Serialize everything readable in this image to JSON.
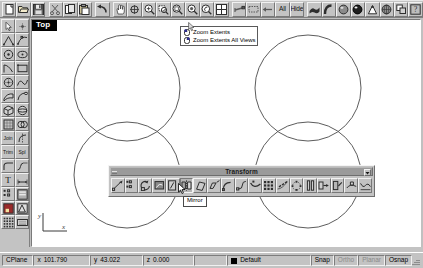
{
  "app": {
    "name": "Rhinoceros",
    "bg_color": "#c0c0c0",
    "accent_color": "#000080"
  },
  "top_toolbar": {
    "name": "standard-toolbar",
    "buttons": [
      {
        "name": "new-file",
        "icon": "new-document-icon",
        "label": ""
      },
      {
        "name": "open-file",
        "icon": "open-folder-icon",
        "label": ""
      },
      {
        "name": "save-file",
        "icon": "save-disk-icon",
        "label": ""
      },
      {
        "name": "cut",
        "icon": "scissors-icon",
        "label": ""
      },
      {
        "name": "copy",
        "icon": "copy-icon",
        "label": ""
      },
      {
        "name": "paste",
        "icon": "paste-icon",
        "label": ""
      },
      {
        "name": "undo",
        "icon": "undo-arrow-icon",
        "label": ""
      },
      {
        "name": "pan",
        "icon": "hand-pan-icon",
        "label": ""
      },
      {
        "name": "zoom-dynamic",
        "icon": "zoom-move-icon",
        "label": ""
      },
      {
        "name": "zoom-in",
        "icon": "magnifier-plus-icon",
        "label": ""
      },
      {
        "name": "zoom-window",
        "icon": "magnifier-window-icon",
        "label": ""
      },
      {
        "name": "zoom-extents",
        "icon": "magnifier-extents-icon",
        "label": ""
      },
      {
        "name": "zoom-selected",
        "icon": "magnifier-selected-icon",
        "label": ""
      },
      {
        "name": "zoom-previous",
        "icon": "magnifier-prev-icon",
        "label": ""
      },
      {
        "name": "viewport-layout",
        "icon": "four-view-grid-icon",
        "label": ""
      },
      {
        "name": "select-objects",
        "icon": "select-arrow-icon",
        "label": ""
      },
      {
        "name": "select-none",
        "icon": "select-none-icon",
        "label": ""
      },
      {
        "name": "select-previous",
        "icon": "select-previous-icon",
        "label": ""
      },
      {
        "name": "select-all",
        "icon": "text-icon",
        "label": "All"
      },
      {
        "name": "hide-objects",
        "icon": "text-icon",
        "label": "Hide"
      },
      {
        "name": "shade-view",
        "icon": "shade-surface-icon",
        "label": ""
      },
      {
        "name": "render-preview",
        "icon": "render-curve-icon",
        "label": ""
      },
      {
        "name": "render-shaded",
        "icon": "sphere-shaded-icon",
        "label": ""
      },
      {
        "name": "render",
        "icon": "sphere-render-icon",
        "label": ""
      },
      {
        "name": "spotlight",
        "icon": "spotlight-icon",
        "label": ""
      },
      {
        "name": "render-properties",
        "icon": "render-globe-icon",
        "label": ""
      },
      {
        "name": "layers",
        "icon": "layers-icon",
        "label": ""
      },
      {
        "name": "help",
        "icon": "help-question-icon",
        "label": ""
      }
    ]
  },
  "left_toolbar": {
    "name": "main-tools-toolbar",
    "buttons": [
      {
        "name": "select-pointer",
        "icon": "arrow-pointer-icon",
        "label": ""
      },
      {
        "name": "point-object",
        "icon": "point-dot-icon",
        "label": ""
      },
      {
        "name": "polyline",
        "icon": "polyline-icon",
        "label": ""
      },
      {
        "name": "curve-control",
        "icon": "curve-point-icon",
        "label": ""
      },
      {
        "name": "circle",
        "icon": "circle-icon",
        "label": ""
      },
      {
        "name": "ellipse",
        "icon": "ellipse-icon",
        "label": ""
      },
      {
        "name": "arc",
        "icon": "arc-icon",
        "label": ""
      },
      {
        "name": "rectangle",
        "icon": "rectangle-icon",
        "label": ""
      },
      {
        "name": "circle-center",
        "icon": "circle-center-icon",
        "label": ""
      },
      {
        "name": "freeform-curve",
        "icon": "freeform-curve-icon",
        "label": ""
      },
      {
        "name": "surface-loft",
        "icon": "surface-loft-icon",
        "label": ""
      },
      {
        "name": "surface-sweep",
        "icon": "surface-sweep-icon",
        "label": ""
      },
      {
        "name": "box-solid",
        "icon": "box-solid-icon",
        "label": ""
      },
      {
        "name": "sphere-solid",
        "icon": "sphere-solid-icon",
        "label": ""
      },
      {
        "name": "mesh-object",
        "icon": "mesh-icon",
        "label": ""
      },
      {
        "name": "boolean-tools",
        "icon": "boolean-icon",
        "label": ""
      },
      {
        "name": "join",
        "icon": "text-icon",
        "label": "Join"
      },
      {
        "name": "split",
        "icon": "split-halves-icon",
        "label": ""
      },
      {
        "name": "trim",
        "icon": "text-icon",
        "label": "Trim"
      },
      {
        "name": "split-tool",
        "icon": "text-icon",
        "label": "Spl"
      },
      {
        "name": "fillet-curves",
        "icon": "fillet-icon",
        "label": ""
      },
      {
        "name": "blend-curves",
        "icon": "blend-icon",
        "label": ""
      },
      {
        "name": "text-object",
        "icon": "text-icon",
        "label": "T"
      },
      {
        "name": "dimension",
        "icon": "dimension-icon",
        "label": ""
      },
      {
        "name": "analyze-points",
        "icon": "analyze-points-icon",
        "label": ""
      },
      {
        "name": "object-props",
        "icon": "properties-icon",
        "label": ""
      },
      {
        "name": "render-tools",
        "icon": "render-tools-icon",
        "label": ""
      },
      {
        "name": "drafting",
        "icon": "drafting-icon",
        "label": ""
      },
      {
        "name": "grid-snap",
        "icon": "grid-snap-icon",
        "label": ""
      },
      {
        "name": "keyboard-panel",
        "icon": "keyboard-icon",
        "label": ""
      }
    ]
  },
  "viewport": {
    "name": "top-viewport",
    "title": "Top",
    "background": "#ffffff",
    "axis": {
      "x_label": "x",
      "y_label": "y"
    },
    "geometry": {
      "type": "circles",
      "stroke": "#4a4a4a",
      "items": [
        {
          "name": "circle-top-left",
          "cx": 95,
          "cy": 68,
          "r": 53
        },
        {
          "name": "circle-top-right",
          "cx": 276,
          "cy": 68,
          "r": 53
        },
        {
          "name": "circle-bottom-left",
          "cx": 95,
          "cy": 155,
          "r": 53
        },
        {
          "name": "circle-bottom-right",
          "cx": 276,
          "cy": 155,
          "r": 53
        }
      ]
    }
  },
  "zoom_popup": {
    "name": "zoom-extents-flyout",
    "items": [
      {
        "label": "Zoom Extents",
        "icon": "mouse-left-button-icon"
      },
      {
        "label": "Zoom Extents All Views",
        "icon": "mouse-right-button-icon"
      }
    ]
  },
  "transform_toolbar": {
    "name": "transform-toolbar",
    "title": "Transform",
    "close_label": "▾",
    "buttons": [
      {
        "name": "move",
        "icon": "move-icon"
      },
      {
        "name": "copy",
        "icon": "copy-objects-icon"
      },
      {
        "name": "rotate",
        "icon": "rotate-icon"
      },
      {
        "name": "rotate-3d",
        "icon": "rotate-3d-icon"
      },
      {
        "name": "scale-1d",
        "icon": "scale-1d-icon"
      },
      {
        "name": "mirror",
        "icon": "mirror-icon"
      },
      {
        "name": "shear",
        "icon": "shear-icon"
      },
      {
        "name": "taper",
        "icon": "taper-icon"
      },
      {
        "name": "bend",
        "icon": "bend-icon"
      },
      {
        "name": "twist",
        "icon": "twist-icon"
      },
      {
        "name": "flow-along-curve",
        "icon": "flow-curve-icon"
      },
      {
        "name": "array-rectangular",
        "icon": "array-grid-icon"
      },
      {
        "name": "array-curve",
        "icon": "array-curve-icon"
      },
      {
        "name": "array-polar",
        "icon": "array-polar-icon"
      },
      {
        "name": "orient-2-points",
        "icon": "orient-two-point-icon"
      },
      {
        "name": "orient-3-points",
        "icon": "orient-three-point-icon"
      },
      {
        "name": "orient-perp",
        "icon": "orient-perp-icon"
      },
      {
        "name": "orient-on-srf",
        "icon": "orient-surface-icon"
      },
      {
        "name": "smash",
        "icon": "smash-icon"
      }
    ],
    "active_button_index": 5
  },
  "tooltip": {
    "name": "mirror-tooltip",
    "text": "Mirror"
  },
  "status_bar": {
    "name": "status-bar",
    "cplane_label": "CPlane",
    "coords": {
      "x_label": "x",
      "x_value": "101.790",
      "y_label": "y",
      "y_value": "43.022",
      "z_label": "z",
      "z_value": "0.000"
    },
    "prompt": "",
    "layer": {
      "label": "Default",
      "color": "#000000"
    },
    "toggles": [
      {
        "label": "Snap",
        "enabled": true
      },
      {
        "label": "Ortho",
        "enabled": false
      },
      {
        "label": "Planar",
        "enabled": false
      },
      {
        "label": "Osnap",
        "enabled": true
      }
    ]
  }
}
